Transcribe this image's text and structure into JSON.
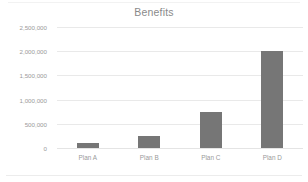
{
  "chart_data": {
    "type": "bar",
    "title": "Benefits",
    "xlabel": "",
    "ylabel": "",
    "categories": [
      "Plan A",
      "Plan B",
      "Plan C",
      "Plan D"
    ],
    "values": [
      100000,
      250000,
      750000,
      2000000
    ],
    "ylim": [
      0,
      2500000
    ],
    "ytick_values": [
      0,
      500000,
      1000000,
      1500000,
      2000000,
      2500000
    ],
    "ytick_labels": [
      "0",
      "500,000",
      "1,000,000",
      "1,500,000",
      "2,000,000",
      "2,500,000"
    ],
    "grid": true,
    "legend": false,
    "bar_color": "#767676",
    "gridline_color": "#e9e9e9",
    "text_color": "#9a9a9a",
    "title_color": "#8a8a8a",
    "background_color": "#ffffff"
  }
}
